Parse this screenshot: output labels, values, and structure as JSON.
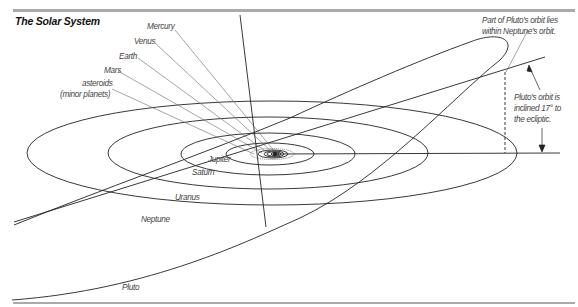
{
  "diagram": {
    "title": "The Solar System",
    "planet_labels": {
      "mercury": "Mercury",
      "venus": "Venus",
      "earth": "Earth",
      "mars": "Mars",
      "asteroids_1": "asteroids",
      "asteroids_2": "(minor planets)",
      "jupiter": "Jupiter",
      "saturn": "Saturn",
      "uranus": "Uranus",
      "neptune": "Neptune",
      "pluto": "Pluto"
    },
    "annotations": {
      "pluto_within_1": "Part of Pluto's orbit lies",
      "pluto_within_2": "within Neptune's orbit.",
      "pluto_incline_1": "Pluto's orbit is",
      "pluto_incline_2": "inclined 17° to",
      "pluto_incline_3": "the ecliptic."
    },
    "inclination_degrees": 17,
    "colors": {
      "line": "#222222",
      "leader": "#666666",
      "label": "#444444",
      "rule": "#aaaaaa"
    }
  }
}
